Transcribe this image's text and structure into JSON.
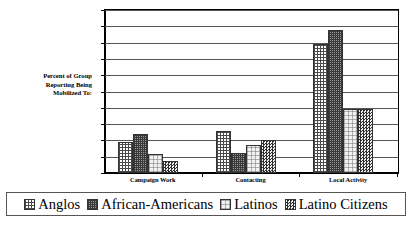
{
  "chart_data": {
    "type": "bar",
    "title": "",
    "subtitle": "",
    "xlabel": "",
    "ylabel": "Percent of Group Reporting Being Mobilized To:",
    "ylabel_lines": [
      "Percent of Group",
      "Reporting Being",
      "Mobilized To:"
    ],
    "categories": [
      "Campaign Work",
      "Contacting",
      "Local Activity"
    ],
    "series": [
      {
        "name": "Anglos",
        "values": [
          9.5,
          13.0,
          39.5
        ],
        "pattern": "crosshatch-grid"
      },
      {
        "name": "African-Americans",
        "values": [
          12.0,
          6.0,
          44.0
        ],
        "pattern": "dense-crosshatch-dark"
      },
      {
        "name": "Latinos",
        "values": [
          5.7,
          8.5,
          19.7
        ],
        "pattern": "light-dotted"
      },
      {
        "name": "Latino Citizens",
        "values": [
          3.7,
          10.2,
          19.7
        ],
        "pattern": "dense-checkerboard"
      }
    ],
    "ylim": [
      0,
      50
    ],
    "yticks": [
      0,
      5,
      10,
      15,
      20,
      25,
      30,
      35,
      40,
      45,
      50
    ],
    "ytick_labels": [
      "0",
      "5",
      "10",
      "15",
      "20",
      "25",
      "30",
      "35",
      "40",
      "45",
      "50"
    ],
    "grid": true,
    "grid_axis": "y",
    "legend_position": "bottom",
    "legend_entries": [
      "Anglos",
      "African-Americans",
      "Latinos",
      "Latino Citizens"
    ],
    "colors": {
      "axis": "#000000",
      "gridline": "#555555",
      "background": "#ffffff",
      "bar_outline": "#333333"
    }
  }
}
